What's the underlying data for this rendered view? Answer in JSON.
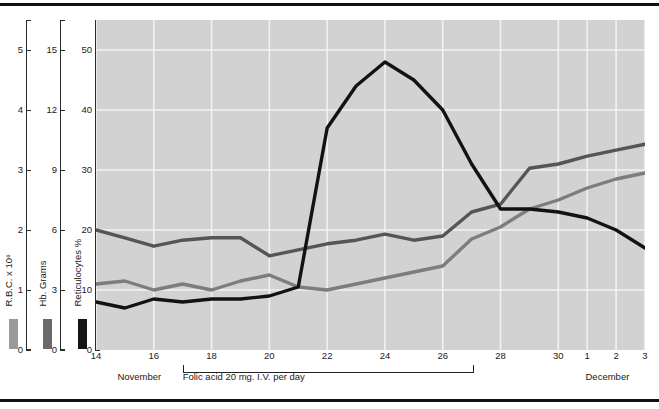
{
  "figure": {
    "background": "#ffffff",
    "plot_background": "#d2d2d2",
    "grid_color": "#f2f2f2",
    "rule_color": "#111111"
  },
  "axes": [
    {
      "name": "rbc",
      "title": "R.B.C. x 10⁶",
      "swatch_color": "#9a9a9a",
      "ticks": [
        "5",
        "4",
        "3",
        "2",
        "1",
        "0"
      ],
      "tick_values": [
        5,
        4,
        3,
        2,
        1,
        0
      ],
      "min": 0,
      "max": 5.5
    },
    {
      "name": "hb",
      "title": "Hb. Grams",
      "swatch_color": "#6a6a6a",
      "ticks": [
        "15",
        "12",
        "9",
        "6",
        "3",
        "0"
      ],
      "tick_values": [
        15,
        12,
        9,
        6,
        3,
        0
      ],
      "min": 0,
      "max": 16.5
    },
    {
      "name": "reticulocytes",
      "title": "Reticulocytes %",
      "swatch_color": "#141414",
      "ticks": [
        "50",
        "40",
        "30",
        "20",
        "10",
        "0"
      ],
      "tick_values": [
        50,
        40,
        30,
        20,
        10,
        0
      ],
      "min": 0,
      "max": 55
    }
  ],
  "xaxis": {
    "tick_labels": [
      "14",
      "16",
      "18",
      "20",
      "22",
      "24",
      "26",
      "28",
      "30",
      "1",
      "2",
      "3"
    ],
    "tick_days": [
      14,
      16,
      18,
      20,
      22,
      24,
      26,
      28,
      30,
      31,
      32,
      33
    ],
    "months": [
      {
        "label": "November",
        "day": 15.5
      },
      {
        "label": "December",
        "day": 31.7
      }
    ]
  },
  "annotation": {
    "label": "Folic acid 20 mg. I.V. per day",
    "start_day": 17,
    "end_day": 27
  },
  "chart_data": {
    "type": "line",
    "title": "",
    "xlabel": "",
    "ylabel": "Reticulocytes %",
    "xlim": [
      14,
      33
    ],
    "ylim": [
      0,
      55
    ],
    "grid": true,
    "legend": "left-axis-swatches",
    "x": [
      14,
      15,
      16,
      17,
      18,
      19,
      20,
      21,
      22,
      23,
      24,
      25,
      26,
      27,
      28,
      29,
      30,
      31,
      32,
      33
    ],
    "x_tick_labels": [
      "14",
      "15",
      "16",
      "17",
      "18",
      "19",
      "20",
      "21",
      "22",
      "23",
      "24",
      "25",
      "26",
      "27",
      "28",
      "29",
      "30",
      "1",
      "2",
      "3"
    ],
    "series": [
      {
        "name": "Hb. Grams",
        "color": "#555555",
        "axis": "hb",
        "unit": "grams",
        "values": [
          6.0,
          5.6,
          5.2,
          5.5,
          5.6,
          5.6,
          4.7,
          5.0,
          5.3,
          5.5,
          5.8,
          5.5,
          5.7,
          6.9,
          7.3,
          9.1,
          9.3,
          9.7,
          10.0,
          10.3
        ],
        "values_on_retic_scale": [
          20.0,
          18.7,
          17.3,
          18.3,
          18.7,
          18.7,
          15.7,
          16.7,
          17.7,
          18.3,
          19.3,
          18.3,
          19.0,
          23.0,
          24.3,
          30.3,
          31.0,
          32.3,
          33.3,
          34.3
        ]
      },
      {
        "name": "R.B.C. x 10⁶",
        "color": "#7d7d7d",
        "axis": "rbc",
        "unit": "x 10^6",
        "values": [
          1.1,
          1.15,
          1.0,
          1.1,
          1.0,
          1.15,
          1.25,
          1.05,
          1.0,
          1.1,
          1.2,
          1.3,
          1.4,
          1.85,
          2.05,
          2.35,
          2.5,
          2.7,
          2.85,
          2.95
        ],
        "values_on_retic_scale": [
          11.0,
          11.5,
          10.0,
          11.0,
          10.0,
          11.5,
          12.5,
          10.5,
          10.0,
          11.0,
          12.0,
          13.0,
          14.0,
          18.5,
          20.5,
          23.5,
          25.0,
          27.0,
          28.5,
          29.5
        ]
      },
      {
        "name": "Reticulocytes %",
        "color": "#121212",
        "axis": "reticulocytes",
        "unit": "%",
        "values": [
          8.0,
          7.0,
          8.5,
          8.0,
          8.5,
          8.5,
          9.0,
          10.5,
          37.0,
          44.0,
          48.0,
          45.0,
          40.0,
          31.0,
          23.5,
          23.5,
          23.0,
          22.0,
          20.0,
          17.0
        ]
      }
    ]
  }
}
